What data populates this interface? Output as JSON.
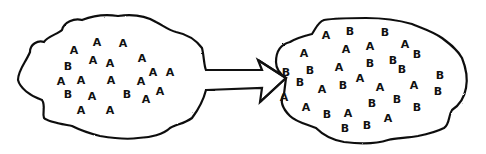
{
  "diagram": {
    "left_cloud": {
      "label": "population-before",
      "letters": [
        {
          "t": "A",
          "x": 74,
          "y": 50
        },
        {
          "t": "A",
          "x": 97,
          "y": 42
        },
        {
          "t": "A",
          "x": 123,
          "y": 43
        },
        {
          "t": "B",
          "x": 68,
          "y": 66
        },
        {
          "t": "A",
          "x": 93,
          "y": 60
        },
        {
          "t": "A",
          "x": 110,
          "y": 63
        },
        {
          "t": "A",
          "x": 142,
          "y": 58
        },
        {
          "t": "A",
          "x": 153,
          "y": 72
        },
        {
          "t": "A",
          "x": 170,
          "y": 72
        },
        {
          "t": "A",
          "x": 61,
          "y": 81
        },
        {
          "t": "A",
          "x": 81,
          "y": 80
        },
        {
          "t": "A",
          "x": 111,
          "y": 80
        },
        {
          "t": "A",
          "x": 141,
          "y": 81
        },
        {
          "t": "B",
          "x": 68,
          "y": 94
        },
        {
          "t": "A",
          "x": 92,
          "y": 96
        },
        {
          "t": "B",
          "x": 127,
          "y": 94
        },
        {
          "t": "A",
          "x": 146,
          "y": 99
        },
        {
          "t": "A",
          "x": 160,
          "y": 91
        },
        {
          "t": "A",
          "x": 81,
          "y": 110
        },
        {
          "t": "A",
          "x": 110,
          "y": 110
        }
      ]
    },
    "arrow": {
      "direction": "right",
      "from": "left_cloud",
      "to": "right_cloud"
    },
    "right_cloud": {
      "label": "population-after",
      "letters": [
        {
          "t": "A",
          "x": 326,
          "y": 35
        },
        {
          "t": "B",
          "x": 350,
          "y": 31
        },
        {
          "t": "B",
          "x": 385,
          "y": 32
        },
        {
          "t": "A",
          "x": 304,
          "y": 53
        },
        {
          "t": "A",
          "x": 346,
          "y": 49
        },
        {
          "t": "A",
          "x": 370,
          "y": 46
        },
        {
          "t": "A",
          "x": 405,
          "y": 44
        },
        {
          "t": "B",
          "x": 417,
          "y": 54
        },
        {
          "t": "B",
          "x": 286,
          "y": 72
        },
        {
          "t": "B",
          "x": 310,
          "y": 70
        },
        {
          "t": "A",
          "x": 339,
          "y": 67
        },
        {
          "t": "B",
          "x": 370,
          "y": 63
        },
        {
          "t": "B",
          "x": 393,
          "y": 60
        },
        {
          "t": "B",
          "x": 402,
          "y": 69
        },
        {
          "t": "B",
          "x": 440,
          "y": 75
        },
        {
          "t": "B",
          "x": 300,
          "y": 82
        },
        {
          "t": "A",
          "x": 360,
          "y": 78
        },
        {
          "t": "A",
          "x": 322,
          "y": 89
        },
        {
          "t": "B",
          "x": 343,
          "y": 85
        },
        {
          "t": "A",
          "x": 380,
          "y": 87
        },
        {
          "t": "A",
          "x": 414,
          "y": 85
        },
        {
          "t": "B",
          "x": 438,
          "y": 91
        },
        {
          "t": "A",
          "x": 284,
          "y": 97
        },
        {
          "t": "B",
          "x": 372,
          "y": 103
        },
        {
          "t": "B",
          "x": 397,
          "y": 99
        },
        {
          "t": "B",
          "x": 417,
          "y": 107
        },
        {
          "t": "A",
          "x": 306,
          "y": 107
        },
        {
          "t": "B",
          "x": 327,
          "y": 114
        },
        {
          "t": "A",
          "x": 348,
          "y": 113
        },
        {
          "t": "A",
          "x": 388,
          "y": 118
        },
        {
          "t": "B",
          "x": 345,
          "y": 128
        },
        {
          "t": "B",
          "x": 367,
          "y": 125
        }
      ]
    },
    "colors": {
      "ink": "#111111",
      "background": "#ffffff"
    }
  }
}
